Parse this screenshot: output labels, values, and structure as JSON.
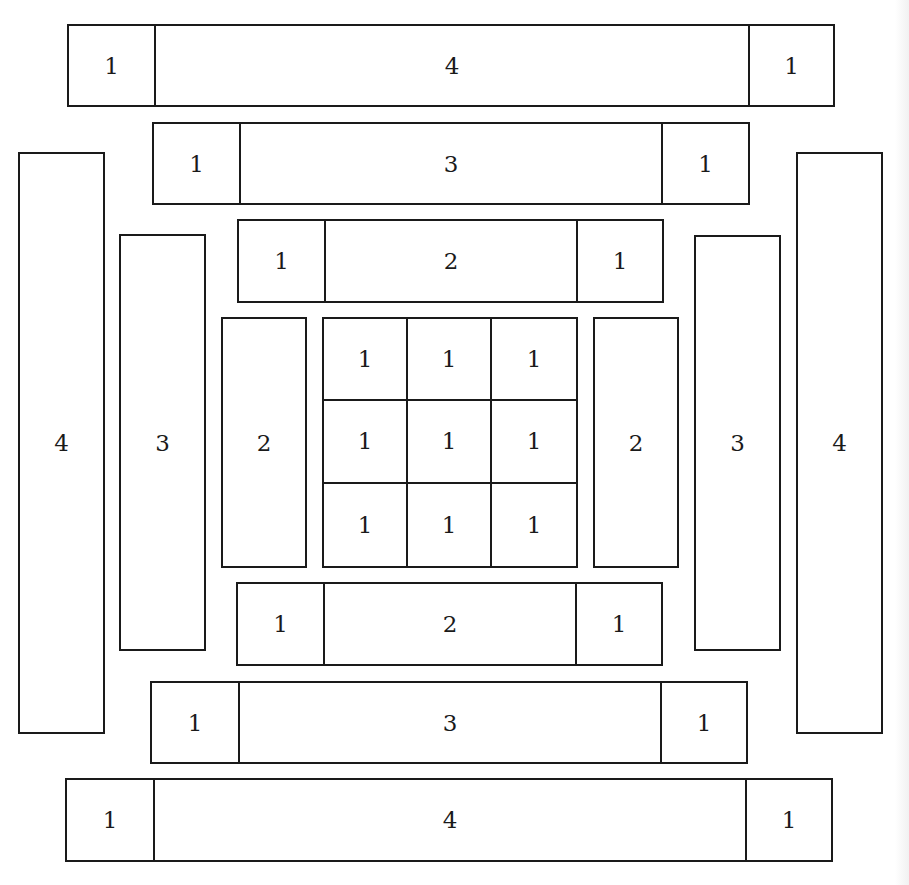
{
  "diagram": {
    "title": "",
    "stroke_color": "#1a1a1a",
    "background": "#ffffff"
  },
  "center_grid": {
    "x": 322,
    "y": 317,
    "w": 256,
    "h": 251,
    "cells": [
      "1",
      "1",
      "1",
      "1",
      "1",
      "1",
      "1",
      "1",
      "1"
    ]
  },
  "horizontal_bars": [
    {
      "id": "top-4",
      "x": 67,
      "y": 24,
      "w": 768,
      "h": 83,
      "cap_w": 85,
      "left_cap": "1",
      "label": "4",
      "right_cap": "1"
    },
    {
      "id": "top-3",
      "x": 152,
      "y": 122,
      "w": 598,
      "h": 83,
      "cap_w": 85,
      "left_cap": "1",
      "label": "3",
      "right_cap": "1"
    },
    {
      "id": "top-2",
      "x": 237,
      "y": 219,
      "w": 427,
      "h": 84,
      "cap_w": 85,
      "left_cap": "1",
      "label": "2",
      "right_cap": "1"
    },
    {
      "id": "bottom-2",
      "x": 236,
      "y": 582,
      "w": 427,
      "h": 84,
      "cap_w": 85,
      "left_cap": "1",
      "label": "2",
      "right_cap": "1"
    },
    {
      "id": "bottom-3",
      "x": 150,
      "y": 681,
      "w": 598,
      "h": 83,
      "cap_w": 86,
      "left_cap": "1",
      "label": "3",
      "right_cap": "1"
    },
    {
      "id": "bottom-4",
      "x": 65,
      "y": 778,
      "w": 768,
      "h": 84,
      "cap_w": 86,
      "left_cap": "1",
      "label": "4",
      "right_cap": "1"
    }
  ],
  "vertical_bars": [
    {
      "id": "left-4",
      "x": 18,
      "y": 152,
      "w": 87,
      "h": 582,
      "label": "4"
    },
    {
      "id": "left-3",
      "x": 119,
      "y": 234,
      "w": 87,
      "h": 417,
      "label": "3"
    },
    {
      "id": "left-2",
      "x": 221,
      "y": 317,
      "w": 86,
      "h": 251,
      "label": "2"
    },
    {
      "id": "right-2",
      "x": 593,
      "y": 317,
      "w": 86,
      "h": 251,
      "label": "2"
    },
    {
      "id": "right-3",
      "x": 694,
      "y": 235,
      "w": 87,
      "h": 416,
      "label": "3"
    },
    {
      "id": "right-4",
      "x": 796,
      "y": 152,
      "w": 87,
      "h": 582,
      "label": "4"
    }
  ]
}
